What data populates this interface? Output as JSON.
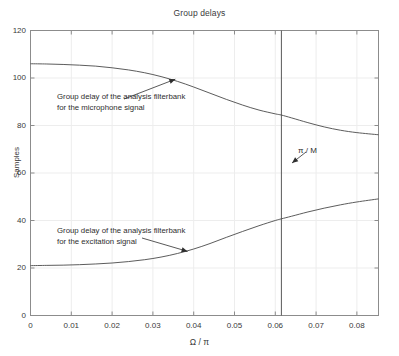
{
  "chart_data": {
    "type": "line",
    "title": "Group delays",
    "xlabel": "Ω / π",
    "ylabel": "Samples",
    "xlim": [
      0,
      0.0853
    ],
    "ylim": [
      0,
      120
    ],
    "xticks": [
      0,
      0.01,
      0.02,
      0.03,
      0.04,
      0.05,
      0.06,
      0.07,
      0.08
    ],
    "xtick_labels": [
      "0",
      "0.01",
      "0.02",
      "0.03",
      "0.04",
      "0.05",
      "0.06",
      "0.07",
      "0.08"
    ],
    "yticks": [
      0,
      20,
      40,
      60,
      80,
      100,
      120
    ],
    "ytick_labels": [
      "0",
      "20",
      "40",
      "60",
      "80",
      "100",
      "120"
    ],
    "grid": true,
    "legend": "none",
    "line_color": "#4a4a4a",
    "grid_color": "#ededed",
    "axis_color": "#8c8c8c",
    "background": "#ffffff",
    "series": [
      {
        "name": "Group delay of the analysis filterbank for the microphone signal",
        "x": [
          0.0,
          0.004,
          0.008,
          0.012,
          0.016,
          0.02,
          0.024,
          0.028,
          0.032,
          0.036,
          0.04,
          0.044,
          0.048,
          0.052,
          0.056,
          0.06,
          0.0615,
          0.064,
          0.068,
          0.072,
          0.076,
          0.08,
          0.0853
        ],
        "values": [
          106.0,
          105.9,
          105.7,
          105.4,
          105.0,
          104.3,
          103.4,
          102.2,
          100.6,
          98.6,
          96.2,
          93.6,
          91.0,
          88.6,
          86.5,
          84.9,
          84.4,
          83.2,
          81.2,
          79.4,
          78.0,
          77.0,
          76.1
        ]
      },
      {
        "name": "Group delay of the analysis filterbank for the excitation signal",
        "x": [
          0.0,
          0.004,
          0.008,
          0.012,
          0.016,
          0.02,
          0.024,
          0.028,
          0.032,
          0.036,
          0.04,
          0.044,
          0.048,
          0.052,
          0.056,
          0.06,
          0.0615,
          0.064,
          0.068,
          0.072,
          0.076,
          0.08,
          0.0853
        ],
        "values": [
          21.0,
          21.1,
          21.2,
          21.4,
          21.7,
          22.1,
          22.7,
          23.5,
          24.6,
          26.1,
          28.0,
          30.3,
          32.9,
          35.4,
          37.8,
          40.0,
          40.7,
          41.8,
          43.6,
          45.2,
          46.6,
          47.8,
          49.1
        ]
      }
    ],
    "vertical_line": {
      "label": "π / M",
      "x": 0.0615
    },
    "annotations": [
      {
        "name": "microphone-annotation",
        "lines": [
          "Group delay of the analysis filterbank",
          "for the microphone signal"
        ],
        "points_to_x": 0.0355,
        "points_to_y": 99.5
      },
      {
        "name": "excitation-annotation",
        "lines": [
          "Group delay of the analysis filterbank",
          "for the excitation signal"
        ],
        "points_to_x": 0.0385,
        "points_to_y": 27.0
      }
    ]
  }
}
